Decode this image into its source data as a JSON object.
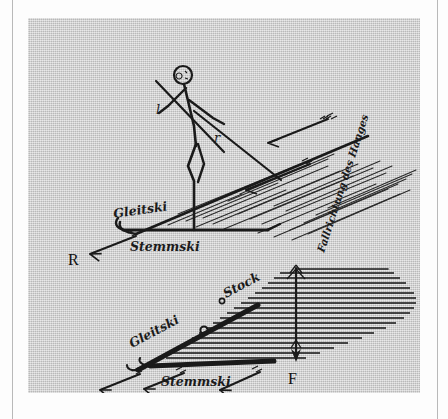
{
  "figure": {
    "caption_language": "German",
    "background_color": "#cdcdcd",
    "ink_color": "#1a1a1a",
    "upper_view": {
      "name": "side-view",
      "labels": {
        "gleitski": "Gleitski",
        "stemmski": "Stemmski",
        "pole_left": "l",
        "pole_right": "r"
      },
      "vectors": {
        "resultant": "R",
        "slope_arrows_count": 2
      },
      "slope_direction_label": "Fallrichtung des Hanges"
    },
    "lower_view": {
      "name": "plan-view",
      "labels": {
        "gleitski": "Gleitski",
        "stemmski": "Stemmski",
        "stock": "Stock"
      },
      "vectors": {
        "fall_line": "F",
        "glide_arrows_count": 3
      }
    }
  }
}
